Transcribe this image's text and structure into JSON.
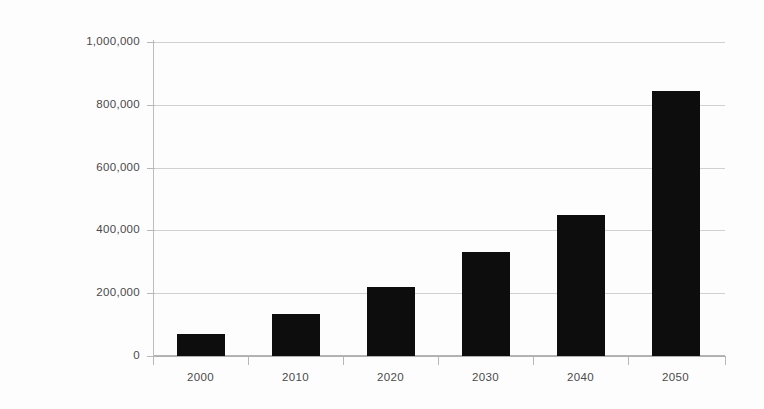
{
  "chart_data": {
    "type": "bar",
    "title": "",
    "subtitle": "",
    "xlabel": "",
    "ylabel": "",
    "categories": [
      "2000",
      "2010",
      "2020",
      "2030",
      "2040",
      "2050"
    ],
    "values": [
      70000,
      135000,
      220000,
      330000,
      450000,
      845000
    ],
    "series": [
      {
        "name": "",
        "values": [
          70000,
          135000,
          220000,
          330000,
          450000,
          845000
        ]
      }
    ],
    "ylim": [
      0,
      1000000
    ],
    "ytick_values": [
      0,
      200000,
      400000,
      600000,
      800000,
      1000000
    ],
    "ytick_labels": [
      "0",
      "200,000",
      "400,000",
      "600,000",
      "800,000",
      "1,000,000"
    ],
    "xtick_labels": [
      "2000",
      "2010",
      "2020",
      "2030",
      "2040",
      "2050"
    ],
    "grid": true,
    "grid_axis": "y",
    "legend": false,
    "legend_position": "none",
    "bar_color": "#0d0d0d",
    "gridline_color": "#c9c9c9",
    "axis_color": "#b4b4b4",
    "background_color": "#fdfdfd",
    "text_color": "#4a4a4a"
  }
}
